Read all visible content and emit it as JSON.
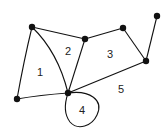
{
  "diagram": {
    "type": "planar-graph",
    "vertices": [
      {
        "id": "A",
        "x": 32,
        "y": 27
      },
      {
        "id": "B",
        "x": 85,
        "y": 39
      },
      {
        "id": "C",
        "x": 123,
        "y": 28
      },
      {
        "id": "D",
        "x": 157,
        "y": 16
      },
      {
        "id": "E",
        "x": 146,
        "y": 61
      },
      {
        "id": "F",
        "x": 68,
        "y": 93
      },
      {
        "id": "G",
        "x": 17,
        "y": 99
      }
    ],
    "edges": [
      [
        "A",
        "B"
      ],
      [
        "B",
        "C"
      ],
      [
        "C",
        "E"
      ],
      [
        "D",
        "E"
      ],
      [
        "A",
        "G"
      ],
      [
        "G",
        "F"
      ],
      [
        "A",
        "F"
      ],
      [
        "B",
        "F"
      ],
      [
        "E",
        "F"
      ],
      [
        "F",
        "F"
      ]
    ],
    "faces": [
      {
        "label": "1",
        "x": 40,
        "y": 72
      },
      {
        "label": "2",
        "x": 68,
        "y": 51
      },
      {
        "label": "3",
        "x": 110,
        "y": 54
      },
      {
        "label": "4",
        "x": 82,
        "y": 110
      },
      {
        "label": "5",
        "x": 121,
        "y": 89
      }
    ]
  }
}
